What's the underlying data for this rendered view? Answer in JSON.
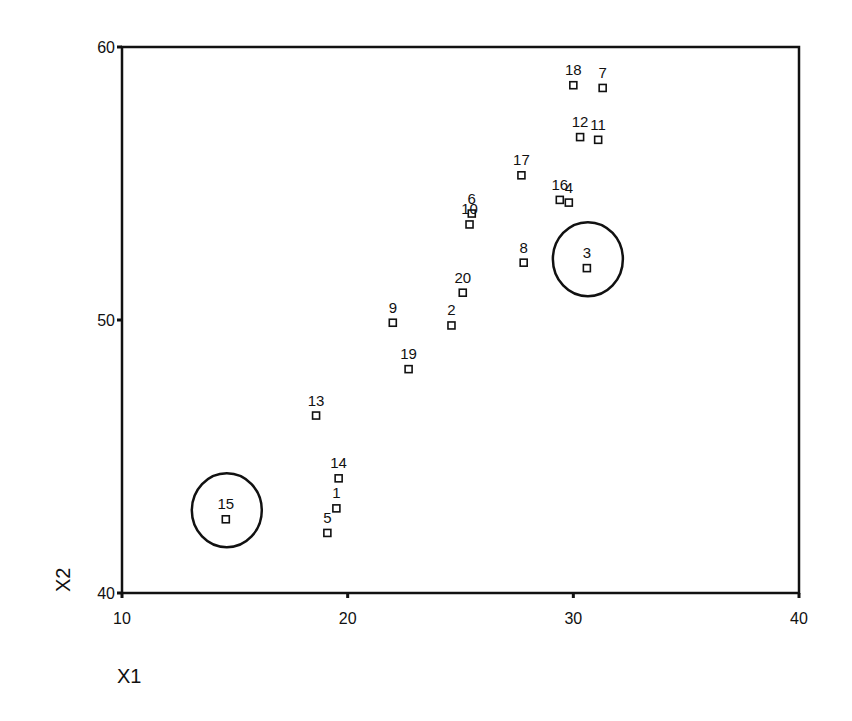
{
  "chart_data": {
    "type": "scatter",
    "title": "",
    "xlabel": "X1",
    "ylabel": "X2",
    "xlim": [
      10,
      40
    ],
    "ylim": [
      40,
      60
    ],
    "xticks": [
      10,
      20,
      30,
      40
    ],
    "yticks": [
      40,
      50,
      60
    ],
    "grid": false,
    "legend": null,
    "marker": "open-square",
    "points": [
      {
        "label": "1",
        "x": 19.5,
        "y": 43.1
      },
      {
        "label": "2",
        "x": 24.6,
        "y": 49.8
      },
      {
        "label": "3",
        "x": 30.6,
        "y": 51.9
      },
      {
        "label": "4",
        "x": 29.8,
        "y": 54.3
      },
      {
        "label": "5",
        "x": 19.1,
        "y": 42.2
      },
      {
        "label": "6",
        "x": 25.5,
        "y": 53.9
      },
      {
        "label": "7",
        "x": 31.3,
        "y": 58.5
      },
      {
        "label": "8",
        "x": 27.8,
        "y": 52.1
      },
      {
        "label": "9",
        "x": 22.0,
        "y": 49.9
      },
      {
        "label": "10",
        "x": 25.4,
        "y": 53.5
      },
      {
        "label": "11",
        "x": 31.1,
        "y": 56.6
      },
      {
        "label": "12",
        "x": 30.3,
        "y": 56.7
      },
      {
        "label": "13",
        "x": 18.6,
        "y": 46.5
      },
      {
        "label": "14",
        "x": 19.6,
        "y": 44.2
      },
      {
        "label": "15",
        "x": 14.6,
        "y": 42.7
      },
      {
        "label": "16",
        "x": 29.4,
        "y": 54.4
      },
      {
        "label": "17",
        "x": 27.7,
        "y": 55.3
      },
      {
        "label": "18",
        "x": 30.0,
        "y": 58.6
      },
      {
        "label": "19",
        "x": 22.7,
        "y": 48.2
      },
      {
        "label": "20",
        "x": 25.1,
        "y": 51.0
      }
    ],
    "annotations": [
      {
        "type": "circle",
        "around_point": "15",
        "note": "outlier highlighted"
      },
      {
        "type": "circle",
        "around_point": "3",
        "note": "outlier highlighted"
      }
    ]
  },
  "axes": {
    "x_title": "X1",
    "y_title": "X2"
  }
}
